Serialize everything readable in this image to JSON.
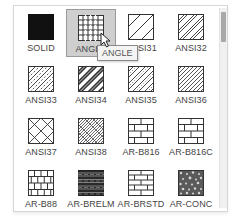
{
  "palette": {
    "selected": "ANGLE",
    "tooltip": "ANGLE",
    "patterns": [
      {
        "name": "SOLID",
        "icon": "solid-fill-icon"
      },
      {
        "name": "ANGLE",
        "icon": "angle-grid-icon"
      },
      {
        "name": "ANSI31",
        "icon": "ansi31-hatch-icon"
      },
      {
        "name": "ANSI32",
        "icon": "ansi32-hatch-icon"
      },
      {
        "name": "ANSI33",
        "icon": "ansi33-hatch-icon"
      },
      {
        "name": "ANSI34",
        "icon": "ansi34-hatch-icon"
      },
      {
        "name": "ANSI35",
        "icon": "ansi35-hatch-icon"
      },
      {
        "name": "ANSI36",
        "icon": "ansi36-hatch-icon"
      },
      {
        "name": "ANSI37",
        "icon": "ansi37-hatch-icon"
      },
      {
        "name": "ANSI38",
        "icon": "ansi38-hatch-icon"
      },
      {
        "name": "AR-B816",
        "icon": "brick-icon"
      },
      {
        "name": "AR-B816C",
        "icon": "brick-icon"
      },
      {
        "name": "AR-B88",
        "icon": "brick-small-icon"
      },
      {
        "name": "AR-BRELM",
        "icon": "brick-elm-icon"
      },
      {
        "name": "AR-BRSTD",
        "icon": "brick-std-icon"
      },
      {
        "name": "AR-CONC",
        "icon": "concrete-icon"
      }
    ]
  },
  "colors": {
    "selected_bg": "#cfcfcf",
    "swatch_stroke": "#333333",
    "scroll_thumb": "#a8a8a8"
  }
}
